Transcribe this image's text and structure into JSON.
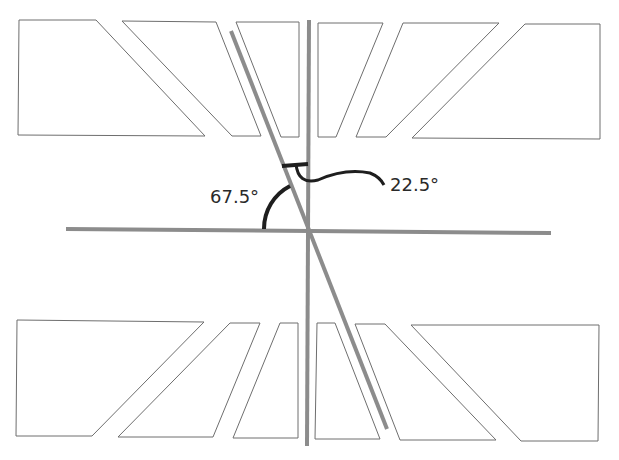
{
  "diagram": {
    "width": 619,
    "height": 460,
    "colors": {
      "background": "#ffffff",
      "shape_stroke": "#6e6e6e",
      "axis_line": "#8c8c8c",
      "arc": "#1e1e1e",
      "text": "#2a2a2a"
    },
    "labels": {
      "angle_left": "67.5°",
      "angle_right": "22.5°"
    },
    "top_shapes": [
      {
        "name": "top-left-block",
        "points": "19,20 96,20 205,136 18,135"
      },
      {
        "name": "top-left-middle-block",
        "points": "122,21 216,22 261,136 232,136"
      },
      {
        "name": "top-left-inner-block",
        "points": "236,22 299,22 299,137 281,137"
      },
      {
        "name": "top-right-inner-block",
        "points": "318,23 383,23 336,137 318,137"
      },
      {
        "name": "top-right-middle-block",
        "points": "403,23 499,23 386,137 356,137"
      },
      {
        "name": "top-right-block",
        "points": "525,24 600,24 600,139 412,138"
      }
    ],
    "bottom_shapes": [
      {
        "name": "bottom-left-block",
        "points": "17,320 204,322 92,436 16,436"
      },
      {
        "name": "bottom-left-middle-block",
        "points": "230,323 260,323 213,437 118,437"
      },
      {
        "name": "bottom-left-inner-block",
        "points": "280,323 298,323 298,438 233,438"
      },
      {
        "name": "bottom-right-inner-block",
        "points": "317,323 335,323 380,439 315,439"
      },
      {
        "name": "bottom-right-middle-block",
        "points": "355,324 385,324 496,440 400,440"
      },
      {
        "name": "bottom-right-block",
        "points": "411,325 599,325 598,441 521,441"
      }
    ],
    "lines": {
      "horizontal": {
        "x1": 66,
        "y1": 229,
        "x2": 551,
        "y2": 233
      },
      "vertical": {
        "x1": 309,
        "y1": 20,
        "x2": 307,
        "y2": 446
      },
      "diagonal": {
        "x1": 231,
        "y1": 31,
        "x2": 387,
        "y2": 429
      }
    },
    "arcs": {
      "angle_67": "M 264 229 A 48 48 0 0 1 290 186",
      "angle_22_bracket": "M 282 166 L 308 164",
      "angle_22_curve": "M 296 164 Q 298 185 318 180 Q 345 168 370 173 Q 380 177 384 185"
    }
  }
}
